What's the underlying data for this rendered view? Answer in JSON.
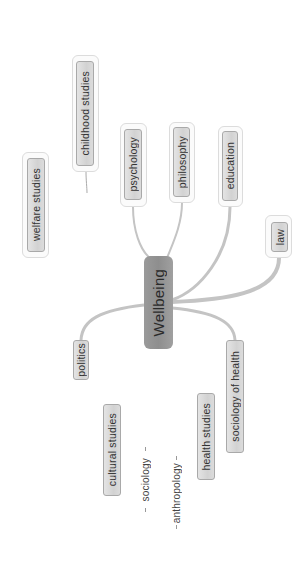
{
  "mindmap": {
    "root": {
      "label": "Wellbeing"
    },
    "nodes": {
      "childhood_studies": {
        "label": "childhood studies"
      },
      "welfare_studies": {
        "label": "welfare studies"
      },
      "psychology": {
        "label": "psychology"
      },
      "philosophy": {
        "label": "philosophy"
      },
      "education": {
        "label": "education"
      },
      "law": {
        "label": "law"
      },
      "politics": {
        "label": "politics"
      },
      "sociology_of_health": {
        "label": "sociology of health"
      },
      "cultural_studies": {
        "label": "cultural studies"
      },
      "sociology": {
        "label": "sociology"
      },
      "anthropology": {
        "label": "anthropology"
      },
      "health_studies": {
        "label": "health studies"
      }
    },
    "colors": {
      "root_fill": "#959595",
      "node_fill": "#d8d8d8",
      "node_border": "#a9a9a9",
      "link": "#bdbdbd",
      "background": "#ffffff"
    }
  }
}
